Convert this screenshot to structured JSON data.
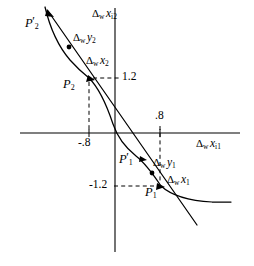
{
  "figure": {
    "width": 254,
    "height": 266,
    "background_color": "#ffffff",
    "ink_color": "#000000"
  },
  "axes": {
    "x_axis_label": {
      "delta": "Δ",
      "delta_sub": "w",
      "var": "x",
      "var_sub": "i1",
      "full": "Δw xi1"
    },
    "y_axis_label": {
      "delta": "Δ",
      "delta_sub": "w",
      "var": "x",
      "var_sub": "i2",
      "full": "Δw xi2"
    },
    "origin": {
      "x": 115,
      "y": 133
    },
    "x_axis_y": 133,
    "y_axis_x": 115
  },
  "ticks": [
    {
      "name": "x-tick-negative",
      "label": "-.8",
      "axis": "x",
      "value": -0.8,
      "px_x": 78,
      "px_y": 145
    },
    {
      "name": "x-tick-positive",
      "label": ".8",
      "axis": "x",
      "value": 0.8,
      "px_x": 161,
      "px_y": 119
    },
    {
      "name": "y-tick-positive",
      "label": "1.2",
      "axis": "y",
      "value": 1.2,
      "px_x": 124,
      "px_y": 79
    },
    {
      "name": "y-tick-negative",
      "label": "-1.2",
      "axis": "y",
      "value": -1.2,
      "px_x": 96,
      "px_y": 186
    }
  ],
  "points": [
    {
      "name": "point-p2-prime",
      "label": {
        "var": "P",
        "sub": "2",
        "prime": true,
        "text": "P'2"
      },
      "px_x": 50,
      "px_y": 14,
      "label_x": 26,
      "label_y": 16,
      "quadrant": "upper-left",
      "description": "endpoint of the within-vector in quadrant II"
    },
    {
      "name": "point-p2",
      "label": {
        "var": "P",
        "sub": "2",
        "prime": false,
        "text": "P2"
      },
      "px_x": 89,
      "px_y": 78,
      "label_x": 63,
      "label_y": 80,
      "quadrant": "upper-left",
      "description": "intersection of the straight line and the curve, at (-.8, 1.2)"
    },
    {
      "name": "point-p1-prime",
      "label": {
        "var": "P",
        "sub": "1",
        "prime": true,
        "text": "P'1"
      },
      "px_x": 143,
      "px_y": 159,
      "label_x": 120,
      "label_y": 153,
      "quadrant": "lower-right",
      "description": "point on the curve above P1"
    },
    {
      "name": "point-p1",
      "label": {
        "var": "P",
        "sub": "1",
        "prime": false,
        "text": "P1"
      },
      "px_x": 160,
      "px_y": 186,
      "label_x": 146,
      "label_y": 188,
      "quadrant": "lower-right",
      "description": "intersection of the straight line and the curve, at (.8, -1.2)"
    },
    {
      "name": "midpoint-dot-upper",
      "label": null,
      "px_x": 69,
      "px_y": 47,
      "description": "dot marking the Dw y2 midpoint on the straight line"
    },
    {
      "name": "midpoint-dot-lower",
      "label": null,
      "px_x": 152,
      "px_y": 173,
      "description": "dot marking the Dw y1 midpoint on the curve"
    }
  ],
  "vector_labels": [
    {
      "name": "label-dw-y2",
      "delta": "Δ",
      "delta_sub": "w",
      "var": "y",
      "var_sub": "2",
      "full": "Δw y2",
      "px_x": 74,
      "px_y": 38
    },
    {
      "name": "label-dw-x2",
      "delta": "Δ",
      "delta_sub": "w",
      "var": "x",
      "var_sub": "2",
      "full": "Δw x2",
      "px_x": 87,
      "px_y": 61
    },
    {
      "name": "label-dw-y1",
      "delta": "Δ",
      "delta_sub": "w",
      "var": "y",
      "var_sub": "1",
      "full": "Δw y1",
      "px_x": 157,
      "px_y": 163
    },
    {
      "name": "label-dw-x1",
      "delta": "Δ",
      "delta_sub": "w",
      "var": "x",
      "var_sub": "1",
      "full": "Δw x1",
      "px_x": 170,
      "px_y": 180
    }
  ],
  "curves": {
    "straight_line": {
      "name": "straight-line",
      "from": {
        "x": 48,
        "y": 12
      },
      "to": {
        "x": 196,
        "y": 224
      },
      "description": "descending straight line through the origin, passing through P2 and P1"
    },
    "hyperbola": {
      "name": "hyperbola-curve",
      "description": "convex decreasing curve passing through P'2, P2, P'1 and P1",
      "points": [
        {
          "x": 45,
          "y": 9
        },
        {
          "x": 55,
          "y": 38
        },
        {
          "x": 66,
          "y": 58
        },
        {
          "x": 78,
          "y": 70
        },
        {
          "x": 89,
          "y": 78
        },
        {
          "x": 104,
          "y": 98
        },
        {
          "x": 113,
          "y": 124
        },
        {
          "x": 122,
          "y": 140
        },
        {
          "x": 133,
          "y": 152
        },
        {
          "x": 145,
          "y": 163
        },
        {
          "x": 160,
          "y": 186
        },
        {
          "x": 180,
          "y": 196
        },
        {
          "x": 205,
          "y": 201
        },
        {
          "x": 228,
          "y": 202
        }
      ]
    },
    "dashed_guides": [
      {
        "name": "guide-p2-horizontal",
        "from": {
          "x": 91,
          "y": 78
        },
        "to": {
          "x": 118,
          "y": 78
        }
      },
      {
        "name": "guide-p2-vertical",
        "from": {
          "x": 89,
          "y": 80
        },
        "to": {
          "x": 89,
          "y": 133
        }
      },
      {
        "name": "guide-p1-vertical",
        "from": {
          "x": 160,
          "y": 125
        },
        "to": {
          "x": 160,
          "y": 184
        }
      },
      {
        "name": "guide-p1-horizontal",
        "from": {
          "x": 114,
          "y": 186
        },
        "to": {
          "x": 158,
          "y": 186
        }
      }
    ]
  }
}
